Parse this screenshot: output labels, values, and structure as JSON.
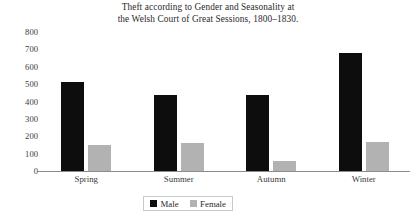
{
  "chart_data": {
    "type": "bar",
    "title": "Theft according to Gender and Seasonality at the Welsh Court of Great Sessions, 1800–1830.",
    "title_lines": [
      "Theft according to Gender and Seasonality at",
      "the Welsh Court of Great Sessions, 1800–1830."
    ],
    "xlabel": "",
    "ylabel": "",
    "ylim": [
      0,
      800
    ],
    "ytick_step": 100,
    "yticks": [
      800,
      700,
      600,
      500,
      400,
      300,
      200,
      100,
      0
    ],
    "ytick_labels": [
      "800",
      "700",
      "600",
      "500",
      "400",
      "300",
      "200",
      "100",
      "0"
    ],
    "grid": false,
    "legend_position": "bottom-center",
    "categories": [
      "Spring",
      "Summer",
      "Autumn",
      "Winter"
    ],
    "series": [
      {
        "name": "Male",
        "color": "#0d0d0d",
        "values": [
          510,
          440,
          435,
          678
        ]
      },
      {
        "name": "Female",
        "color": "#b2b2b2",
        "values": [
          150,
          160,
          58,
          168
        ]
      }
    ]
  },
  "legend": {
    "items": [
      {
        "label": "Male",
        "color": "#0d0d0d"
      },
      {
        "label": "Female",
        "color": "#b2b2b2"
      }
    ]
  },
  "colors": {
    "male": "#0d0d0d",
    "female": "#b2b2b2",
    "axis": "#8c8c8c",
    "text": "#2a2a2a",
    "background": "#ffffff"
  }
}
